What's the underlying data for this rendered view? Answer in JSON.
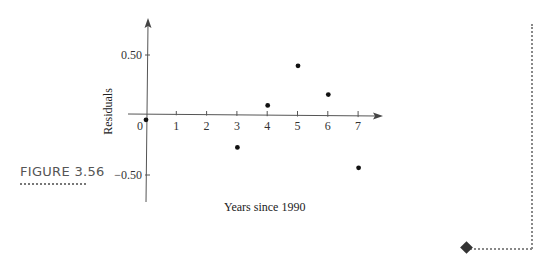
{
  "figure": {
    "label": "FIGURE 3.56"
  },
  "chart_data": {
    "type": "scatter",
    "title": "",
    "xlabel": "Years since 1990",
    "ylabel": "Residuals",
    "x_ticks": [
      "0",
      "1",
      "2",
      "3",
      "4",
      "5",
      "6",
      "7"
    ],
    "y_ticks": [
      "0.50",
      "-0.50"
    ],
    "xlim": [
      0,
      7.7
    ],
    "ylim": [
      -0.72,
      0.78
    ],
    "grid": false,
    "legend": null,
    "points": [
      {
        "x": 0,
        "y": -0.04
      },
      {
        "x": 3,
        "y": -0.27
      },
      {
        "x": 4,
        "y": 0.08
      },
      {
        "x": 5,
        "y": 0.41
      },
      {
        "x": 6,
        "y": 0.17
      },
      {
        "x": 7,
        "y": -0.44
      }
    ]
  }
}
